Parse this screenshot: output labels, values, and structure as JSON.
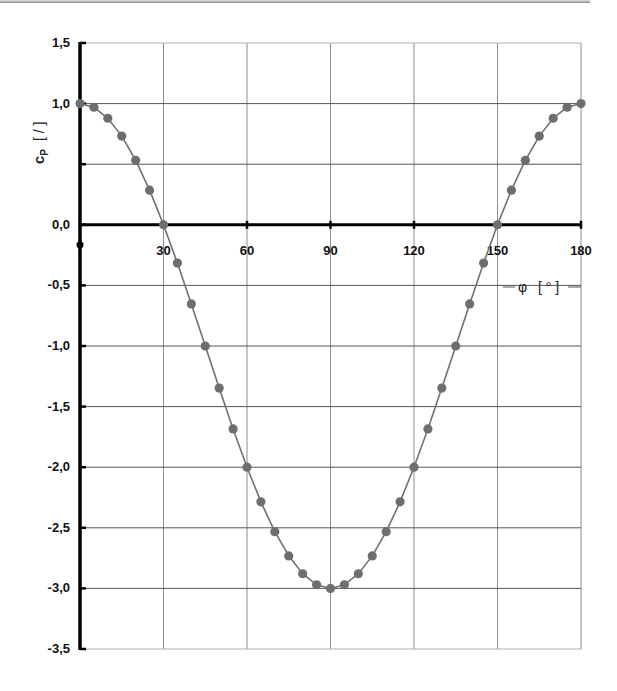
{
  "chart_data": {
    "type": "line",
    "title": "",
    "xlabel": "φ [°]",
    "ylabel": "cp [/]",
    "xlim": [
      0,
      180
    ],
    "ylim": [
      -3.5,
      1.5
    ],
    "grid": true,
    "legend": null,
    "x_ticks": [
      0,
      30,
      60,
      90,
      120,
      150,
      180
    ],
    "x_tick_labels": [
      "0",
      "30",
      "60",
      "90",
      "120",
      "150",
      "180"
    ],
    "y_ticks": [
      1.5,
      1.0,
      0.5,
      0.0,
      -0.5,
      -1.0,
      -1.5,
      -2.0,
      -2.5,
      -3.0,
      -3.5
    ],
    "y_tick_labels": [
      "1,5",
      "1,0",
      "",
      "0,0",
      "-0,5",
      "-1,0",
      "-1,5",
      "-2,0",
      "-2,5",
      "-3,0",
      "-3,5"
    ],
    "series": [
      {
        "name": "cp = 1 - 4 sin²φ",
        "color": "#707070",
        "marker": "circle",
        "x": [
          0,
          5,
          10,
          15,
          20,
          25,
          30,
          35,
          40,
          45,
          50,
          55,
          60,
          65,
          70,
          75,
          80,
          85,
          90,
          95,
          100,
          105,
          110,
          115,
          120,
          125,
          130,
          135,
          140,
          145,
          150,
          155,
          160,
          165,
          170,
          175,
          180
        ],
        "y": [
          1.0,
          0.97,
          0.879,
          0.732,
          0.532,
          0.286,
          0.0,
          -0.316,
          -0.653,
          -1.0,
          -1.347,
          -1.684,
          -2.0,
          -2.286,
          -2.532,
          -2.732,
          -2.879,
          -2.97,
          -3.0,
          -2.97,
          -2.879,
          -2.732,
          -2.532,
          -2.286,
          -2.0,
          -1.684,
          -1.347,
          -1.0,
          -0.653,
          -0.316,
          0.0,
          0.286,
          0.532,
          0.732,
          0.879,
          0.97,
          1.0
        ]
      }
    ]
  },
  "labels": {
    "y_axis_c": "c",
    "y_axis_sub": "P",
    "y_axis_unit": "[ / ]",
    "x_axis_phi": "φ",
    "x_axis_unit": "[ ° ]"
  }
}
